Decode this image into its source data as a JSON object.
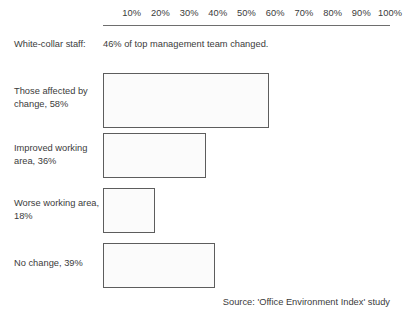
{
  "chart_data": {
    "type": "bar",
    "orientation": "horizontal",
    "title": "",
    "xlabel": "",
    "ylabel": "",
    "xlim": [
      0,
      100
    ],
    "grid": false,
    "legend": false,
    "axis_ticks": [
      "10%",
      "20%",
      "30%",
      "40%",
      "50%",
      "60%",
      "70%",
      "80%",
      "90%",
      "100%"
    ],
    "axis_tick_values": [
      10,
      20,
      30,
      40,
      50,
      60,
      70,
      80,
      90,
      100
    ],
    "categories": [
      "Those affected by change, 58%",
      "Improved working area, 36%",
      "Worse working area, 18%",
      "No change, 39%"
    ],
    "values": [
      58,
      36,
      18,
      39
    ],
    "annotations": [
      {
        "label": "White-collar staff:",
        "text": "46% of top management team changed.",
        "value": 46
      }
    ],
    "source": "Source: 'Office Environment Index' study",
    "colors": {
      "bar_fill": "#fbfbfb",
      "bar_border": "#5d5d5d",
      "text": "#3b3b3b",
      "axis_rule": "#6e6e6e",
      "background": "#ffffff"
    }
  },
  "note_row": {
    "label": "White-collar staff:",
    "value": "46% of top management team changed."
  },
  "bars": [
    {
      "label": "Those affected by change, 58%",
      "value": 58
    },
    {
      "label": "Improved working area, 36%",
      "value": 36
    },
    {
      "label": "Worse working area, 18%",
      "value": 18
    },
    {
      "label": "No change, 39%",
      "value": 39
    }
  ],
  "source": "Source: 'Office Environment Index' study"
}
